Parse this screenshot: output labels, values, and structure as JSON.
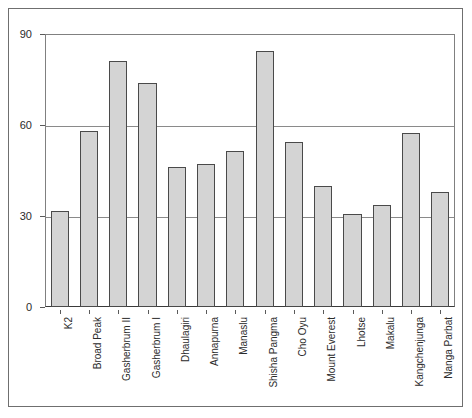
{
  "chart_data": {
    "type": "bar",
    "title": "",
    "xlabel": "",
    "ylabel": "",
    "categories": [
      "K2",
      "Broad Peak",
      "Gasherbrum II",
      "Gasherbrum I",
      "Dhaulagiri",
      "Annapurna",
      "Manaslu",
      "Shisha Pangma",
      "Cho Oyu",
      "Mount Everest",
      "Lhotse",
      "Makalu",
      "Kangchenjunga",
      "Nanga Parbat"
    ],
    "values": [
      31.5,
      58,
      81,
      74,
      46,
      47,
      51.5,
      84.5,
      54.5,
      40,
      30.5,
      33.5,
      57.5,
      38
    ],
    "ylim": [
      0,
      90
    ],
    "yticks": [
      0,
      30,
      60,
      90
    ],
    "ytick_labels": [
      "0",
      "30",
      "60",
      "90"
    ],
    "grid": true,
    "gridlines_at": [
      30,
      60
    ],
    "legend": null,
    "legend_position": "none",
    "bar_fill_color": "#d4d4d4",
    "bar_border_color": "#4a4a4a",
    "gridline_color": "#8a8a8a",
    "axis_color": "#3a3a3a",
    "background_color": "#ffffff"
  }
}
